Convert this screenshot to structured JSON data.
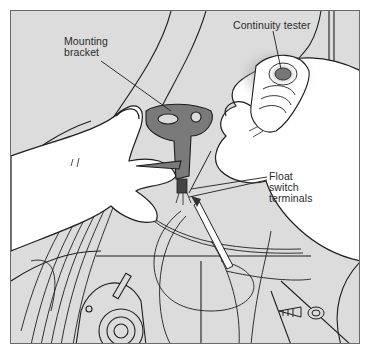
{
  "figure": {
    "colors": {
      "background": "#dcdcdc",
      "frame_border": "#6a6a6a",
      "hand": "#ffffff",
      "bracket": "#7a7a7a",
      "line": "#1e1e1e",
      "label_text": "#2a2a2a"
    }
  },
  "callouts": {
    "mounting_bracket": {
      "line1": "Mounting",
      "line2": "bracket"
    },
    "continuity_tester": {
      "line1": "Continuity tester"
    },
    "float_switch_terminals": {
      "line1": "Float",
      "line2": "switch",
      "line3": "terminals"
    }
  }
}
